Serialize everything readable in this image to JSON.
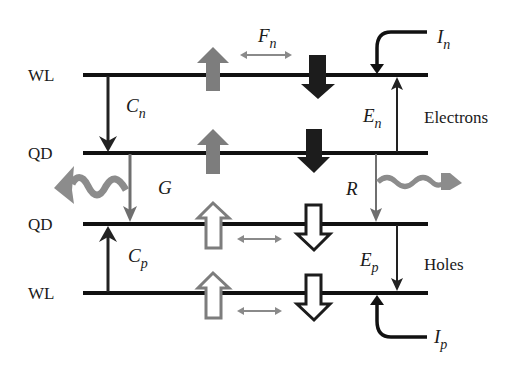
{
  "diagram": {
    "levels": [
      {
        "label": "WL",
        "y": 75
      },
      {
        "label": "QD",
        "y": 153
      },
      {
        "label": "QD",
        "y": 224
      },
      {
        "label": "WL",
        "y": 293
      }
    ],
    "groups": {
      "electrons": "Electrons",
      "holes": "Holes"
    },
    "processes": {
      "capture_electrons": {
        "main": "C",
        "sub": "n"
      },
      "capture_holes": {
        "main": "C",
        "sub": "p"
      },
      "escape_electrons": {
        "main": "E",
        "sub": "n"
      },
      "escape_holes": {
        "main": "E",
        "sub": "p"
      },
      "injection_electrons": {
        "main": "I",
        "sub": "n"
      },
      "injection_holes": {
        "main": "I",
        "sub": "p"
      },
      "spin_flip": {
        "main": "F",
        "sub": "n"
      },
      "generation": "G",
      "recombination": "R"
    },
    "colors": {
      "line": "#111111",
      "dark_arrow": "#1c1c1c",
      "gray_arrow": "#7a7a7a",
      "light_gray": "#9a9a9a",
      "wave": "#8c8c8c"
    }
  }
}
